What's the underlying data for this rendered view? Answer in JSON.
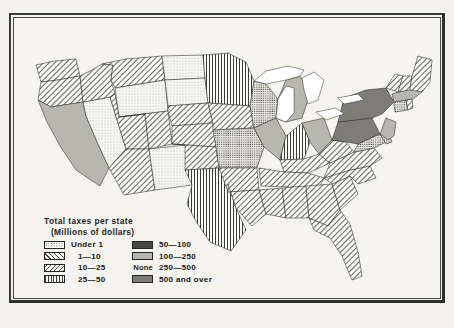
{
  "figure": {
    "kind": "choropleth-map",
    "region": "United States",
    "legend": {
      "title": "Total taxes per state",
      "subtitle": "(Millions of dollars)",
      "none_label": "None",
      "classes": [
        {
          "label": "Under 1",
          "pattern": "stipple-light",
          "column": "left"
        },
        {
          "label": "1—10",
          "pattern": "diagonal-forward",
          "column": "left"
        },
        {
          "label": "10—25",
          "pattern": "diagonal-back",
          "column": "left"
        },
        {
          "label": "25—50",
          "pattern": "vertical-lines",
          "column": "left"
        },
        {
          "label": "50—100",
          "pattern": "stipple-dense",
          "column": "right"
        },
        {
          "label": "100—250",
          "pattern": "solid-gray",
          "column": "right"
        },
        {
          "label": "250—500",
          "pattern": "none",
          "column": "right"
        },
        {
          "label": "500 and over",
          "pattern": "solid-dark",
          "column": "right"
        }
      ]
    },
    "colors": {
      "paper": "#f2f1ec",
      "frame": "#3a3a38",
      "ink": "#1d1d1b",
      "gray_100_250": "#b8b7ae",
      "gray_500_over": "#7e7d75",
      "water": "#ffffff"
    },
    "states": [
      {
        "code": "WA",
        "class": 1
      },
      {
        "code": "OR",
        "class": 1
      },
      {
        "code": "CA",
        "class": 5
      },
      {
        "code": "NV",
        "class": 0
      },
      {
        "code": "ID",
        "class": 1
      },
      {
        "code": "MT",
        "class": 1
      },
      {
        "code": "WY",
        "class": 0
      },
      {
        "code": "UT",
        "class": 1
      },
      {
        "code": "AZ",
        "class": 1
      },
      {
        "code": "NM",
        "class": 0
      },
      {
        "code": "CO",
        "class": 1
      },
      {
        "code": "ND",
        "class": 0
      },
      {
        "code": "SD",
        "class": 0
      },
      {
        "code": "NE",
        "class": 1
      },
      {
        "code": "KS",
        "class": 1
      },
      {
        "code": "OK",
        "class": 1
      },
      {
        "code": "TX",
        "class": 3
      },
      {
        "code": "MN",
        "class": 3
      },
      {
        "code": "IA",
        "class": 1
      },
      {
        "code": "MO",
        "class": 4
      },
      {
        "code": "AR",
        "class": 1
      },
      {
        "code": "LA",
        "class": 1
      },
      {
        "code": "WI",
        "class": 4
      },
      {
        "code": "IL",
        "class": 5
      },
      {
        "code": "MI",
        "class": 5
      },
      {
        "code": "IN",
        "class": 3
      },
      {
        "code": "OH",
        "class": 5
      },
      {
        "code": "KY",
        "class": 1
      },
      {
        "code": "TN",
        "class": 1
      },
      {
        "code": "MS",
        "class": 1
      },
      {
        "code": "AL",
        "class": 1
      },
      {
        "code": "GA",
        "class": 1
      },
      {
        "code": "FL",
        "class": 1
      },
      {
        "code": "SC",
        "class": 1
      },
      {
        "code": "NC",
        "class": 1
      },
      {
        "code": "VA",
        "class": 1
      },
      {
        "code": "WV",
        "class": 1
      },
      {
        "code": "PA",
        "class": 7
      },
      {
        "code": "NY",
        "class": 7
      },
      {
        "code": "MD",
        "class": 4
      },
      {
        "code": "DE",
        "class": 4
      },
      {
        "code": "NJ",
        "class": 5
      },
      {
        "code": "CT",
        "class": 4
      },
      {
        "code": "RI",
        "class": 1
      },
      {
        "code": "MA",
        "class": 5
      },
      {
        "code": "VT",
        "class": 1
      },
      {
        "code": "NH",
        "class": 1
      },
      {
        "code": "ME",
        "class": 1
      }
    ]
  }
}
